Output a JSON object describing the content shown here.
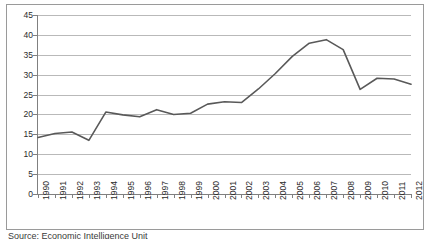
{
  "caption": "Source: Economic Intelligence Unit",
  "colors": {
    "line": "#595959",
    "grid": "#b9b9b9",
    "axis": "#808080",
    "frame": "#9a9a9a",
    "background": "#ffffff",
    "text": "#2b2b2b"
  },
  "chart_data": {
    "type": "line",
    "title": "",
    "subtitle": "",
    "xlabel": "",
    "ylabel": "",
    "categories": [
      "1990",
      "1991",
      "1992",
      "1993",
      "1994",
      "1995",
      "1996",
      "1997",
      "1998",
      "1999",
      "2000",
      "2001",
      "2002",
      "2003",
      "2004",
      "2005",
      "2006",
      "2007",
      "2008",
      "2009",
      "2010",
      "2011",
      "2012"
    ],
    "values": [
      14.2,
      15.2,
      15.6,
      13.5,
      20.6,
      19.9,
      19.4,
      21.2,
      20.0,
      20.3,
      22.6,
      23.2,
      23.0,
      26.4,
      30.3,
      34.6,
      37.9,
      38.8,
      36.3,
      26.3,
      29.1,
      28.9,
      27.6
    ],
    "series": [
      {
        "name": "series-1",
        "values": [
          14.2,
          15.2,
          15.6,
          13.5,
          20.6,
          19.9,
          19.4,
          21.2,
          20.0,
          20.3,
          22.6,
          23.2,
          23.0,
          26.4,
          30.3,
          34.6,
          37.9,
          38.8,
          36.3,
          26.3,
          29.1,
          28.9,
          27.6
        ]
      }
    ],
    "ylim": [
      0,
      45
    ],
    "yticks": [
      0,
      5,
      10,
      15,
      20,
      25,
      30,
      35,
      40,
      45
    ],
    "ytick_labels": [
      "0",
      "5",
      "10",
      "15",
      "20",
      "25",
      "30",
      "35",
      "40",
      "45"
    ],
    "grid": true,
    "grid_axis": "y",
    "legend": false,
    "legend_position": "none",
    "markers": false
  }
}
